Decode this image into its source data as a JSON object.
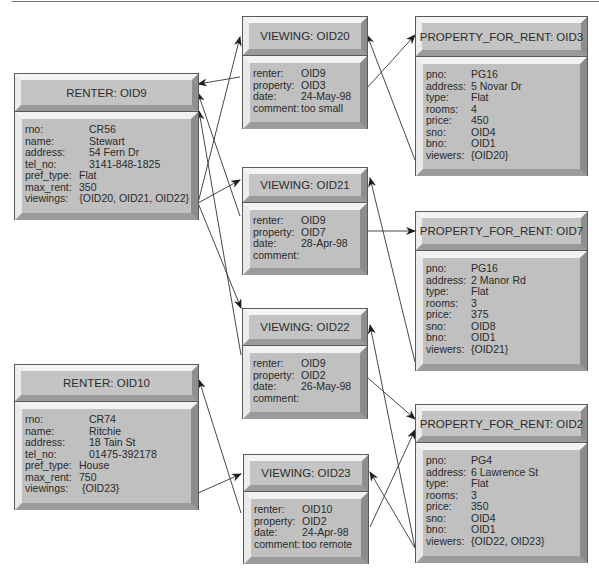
{
  "diagram": {
    "colors": {
      "box_fill": "#c0c0c0",
      "box_border": "#5a5a5a",
      "bevel_light": "#f2f2f2",
      "bevel_dark": "#8c8c8c",
      "line": "#333333",
      "text": "#2a2a2a"
    },
    "renters": [
      {
        "title": "RENTER: OID9",
        "fields": [
          {
            "key": "rno:",
            "value": "CR56"
          },
          {
            "key": "name:",
            "value": "Stewart"
          },
          {
            "key": "address:",
            "value": "54 Fern Dr"
          },
          {
            "key": "tel_no:",
            "value": "3141-848-1825"
          },
          {
            "key": "pref_type:",
            "value": "Flat"
          },
          {
            "key": "max_rent:",
            "value": "350"
          },
          {
            "key": "viewings:",
            "value": "{OID20, OID21, OID22}"
          }
        ]
      },
      {
        "title": "RENTER: OID10",
        "fields": [
          {
            "key": "rno:",
            "value": "CR74"
          },
          {
            "key": "name:",
            "value": "Ritchie"
          },
          {
            "key": "address:",
            "value": "18 Tain St"
          },
          {
            "key": "tel_no:",
            "value": "01475-392178"
          },
          {
            "key": "pref_type:",
            "value": "House"
          },
          {
            "key": "max_rent:",
            "value": "750"
          },
          {
            "key": "viewings:",
            "value": "{OID23}"
          }
        ]
      }
    ],
    "viewings": [
      {
        "title": "VIEWING: OID20",
        "fields": [
          {
            "key": "renter:",
            "value": "OID9"
          },
          {
            "key": "property:",
            "value": "OID3"
          },
          {
            "key": "date:",
            "value": "24-May-98"
          },
          {
            "key": "comment:",
            "value": "too small"
          }
        ]
      },
      {
        "title": "VIEWING: OID21",
        "fields": [
          {
            "key": "renter:",
            "value": "OID9"
          },
          {
            "key": "property:",
            "value": "OID7"
          },
          {
            "key": "date:",
            "value": "28-Apr-98"
          },
          {
            "key": "comment:",
            "value": ""
          }
        ]
      },
      {
        "title": "VIEWING: OID22",
        "fields": [
          {
            "key": "renter:",
            "value": "OID9"
          },
          {
            "key": "property:",
            "value": "OID2"
          },
          {
            "key": "date:",
            "value": "26-May-98"
          },
          {
            "key": "comment:",
            "value": ""
          }
        ]
      },
      {
        "title": "VIEWING: OID23",
        "fields": [
          {
            "key": "renter:",
            "value": "OID10"
          },
          {
            "key": "property:",
            "value": "OID2"
          },
          {
            "key": "date:",
            "value": "24-Apr-98"
          },
          {
            "key": "comment:",
            "value": "too remote"
          }
        ]
      }
    ],
    "properties": [
      {
        "title": "PROPERTY_FOR_RENT: OID3",
        "fields": [
          {
            "key": "pno:",
            "value": "PG16"
          },
          {
            "key": "address:",
            "value": "5 Novar Dr"
          },
          {
            "key": "type:",
            "value": "Flat"
          },
          {
            "key": "rooms:",
            "value": "4"
          },
          {
            "key": "price:",
            "value": "450"
          },
          {
            "key": "sno:",
            "value": "OID4"
          },
          {
            "key": "bno:",
            "value": "OID1"
          },
          {
            "key": "viewers:",
            "value": "{OID20}"
          }
        ]
      },
      {
        "title": "PROPERTY_FOR_RENT: OID7",
        "fields": [
          {
            "key": "pno:",
            "value": "PG16"
          },
          {
            "key": "address:",
            "value": "2 Manor Rd"
          },
          {
            "key": "type:",
            "value": "Flat"
          },
          {
            "key": "rooms:",
            "value": "3"
          },
          {
            "key": "price:",
            "value": "375"
          },
          {
            "key": "sno:",
            "value": "OID8"
          },
          {
            "key": "bno:",
            "value": "OID1"
          },
          {
            "key": "viewers:",
            "value": "{OID21}"
          }
        ]
      },
      {
        "title": "PROPERTY_FOR_RENT: OID2",
        "fields": [
          {
            "key": "pno:",
            "value": "PG4"
          },
          {
            "key": "address:",
            "value": "6 Lawrence St"
          },
          {
            "key": "type:",
            "value": "Flat"
          },
          {
            "key": "rooms:",
            "value": "3"
          },
          {
            "key": "price:",
            "value": "350"
          },
          {
            "key": "sno:",
            "value": "OID4"
          },
          {
            "key": "bno:",
            "value": "OID1"
          },
          {
            "key": "viewers:",
            "value": "{OID22, OID23}"
          }
        ]
      }
    ],
    "links": [
      {
        "from": "RENTER: OID9.viewings",
        "to": "VIEWING: OID20"
      },
      {
        "from": "RENTER: OID9.viewings",
        "to": "VIEWING: OID21"
      },
      {
        "from": "RENTER: OID9.viewings",
        "to": "VIEWING: OID22"
      },
      {
        "from": "VIEWING: OID20.renter",
        "to": "RENTER: OID9"
      },
      {
        "from": "VIEWING: OID21.renter",
        "to": "RENTER: OID9"
      },
      {
        "from": "VIEWING: OID22.renter",
        "to": "RENTER: OID9"
      },
      {
        "from": "VIEWING: OID20.property",
        "to": "PROPERTY_FOR_RENT: OID3"
      },
      {
        "from": "VIEWING: OID21.property",
        "to": "PROPERTY_FOR_RENT: OID7"
      },
      {
        "from": "VIEWING: OID22.property",
        "to": "PROPERTY_FOR_RENT: OID2"
      },
      {
        "from": "VIEWING: OID23.property",
        "to": "PROPERTY_FOR_RENT: OID2"
      },
      {
        "from": "PROPERTY_FOR_RENT: OID3.viewers",
        "to": "VIEWING: OID20"
      },
      {
        "from": "PROPERTY_FOR_RENT: OID7.viewers",
        "to": "VIEWING: OID21"
      },
      {
        "from": "PROPERTY_FOR_RENT: OID2.viewers",
        "to": "VIEWING: OID22"
      },
      {
        "from": "PROPERTY_FOR_RENT: OID2.viewers",
        "to": "VIEWING: OID23"
      },
      {
        "from": "RENTER: OID10.viewings",
        "to": "VIEWING: OID23"
      },
      {
        "from": "VIEWING: OID23.renter",
        "to": "RENTER: OID10"
      }
    ]
  }
}
